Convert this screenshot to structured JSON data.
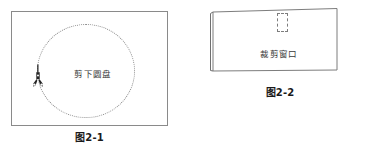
{
  "page": {
    "width": 372,
    "height": 149,
    "background": "#ffffff",
    "line_color": "#8a8a8a",
    "text_color": "#3a3a3a",
    "caption_color": "#1a1a1a"
  },
  "figures": [
    {
      "id": "fig2-1",
      "caption": "图2-1",
      "inner_label": "剪下圆盘",
      "shapes": [
        {
          "name": "outer-rectangle",
          "style": "solid"
        },
        {
          "name": "dotted-circle",
          "style": "dotted"
        },
        {
          "name": "scissors-icon",
          "style": "filled"
        }
      ]
    },
    {
      "id": "fig2-2",
      "caption": "图2-2",
      "inner_label": "裁剪窗口",
      "shapes": [
        {
          "name": "folded-sheet",
          "style": "solid"
        },
        {
          "name": "dashed-cutout-rectangle",
          "style": "dashed"
        }
      ]
    }
  ],
  "icons": {
    "scissors": "scissors-icon"
  }
}
